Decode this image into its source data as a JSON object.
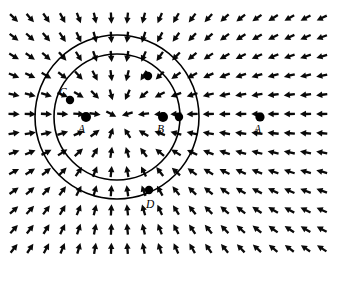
{
  "figure": {
    "width": 340,
    "height": 283,
    "background_color": "#ffffff",
    "line_color": "#000000",
    "arrow_color": "#0a0a0a"
  },
  "chart_data": {
    "type": "scatter",
    "title": "",
    "xlabel": "",
    "ylabel": "",
    "grid": false,
    "legend": null,
    "field": {
      "kind": "vector-field",
      "direction": "radially inward toward center",
      "center": [
        117,
        117
      ],
      "columns": 20,
      "rows": 13,
      "x_start": 14,
      "y_start": 18,
      "dx": 16.2,
      "dy": 19.2,
      "arrow_length": 11,
      "uniform_magnitude": true
    },
    "circles": [
      {
        "name": "inner-circle",
        "cx": 117,
        "cy": 117,
        "r": 63
      },
      {
        "name": "outer-circle",
        "cx": 117,
        "cy": 117,
        "r": 82
      }
    ],
    "points": [
      {
        "id": "A-center",
        "label": "A",
        "x": 86,
        "y": 117,
        "r": 5.0,
        "label_x": 78,
        "label_y": 133,
        "labeled": true
      },
      {
        "id": "B-inner",
        "label": "B",
        "x": 163,
        "y": 117,
        "r": 5.0,
        "label_x": 157,
        "label_y": 133,
        "labeled": true
      },
      {
        "id": "C-inner",
        "label": "C",
        "x": 70,
        "y": 100,
        "r": 4.2,
        "label_x": 59,
        "label_y": 96,
        "labeled": true
      },
      {
        "id": "D-inner",
        "label": "D",
        "x": 149,
        "y": 190,
        "r": 4.2,
        "label_x": 146,
        "label_y": 208,
        "labeled": true
      },
      {
        "id": "A-right",
        "label": "A",
        "x": 260,
        "y": 117,
        "r": 4.6,
        "label_x": 254,
        "label_y": 133,
        "labeled": true
      },
      {
        "id": "dot-upper-right",
        "label": "",
        "x": 148,
        "y": 76,
        "r": 4.2,
        "label_x": 0,
        "label_y": 0,
        "labeled": false
      },
      {
        "id": "dot-right-inner",
        "label": "",
        "x": 179,
        "y": 117,
        "r": 4.2,
        "label_x": 0,
        "label_y": 0,
        "labeled": false
      }
    ]
  }
}
